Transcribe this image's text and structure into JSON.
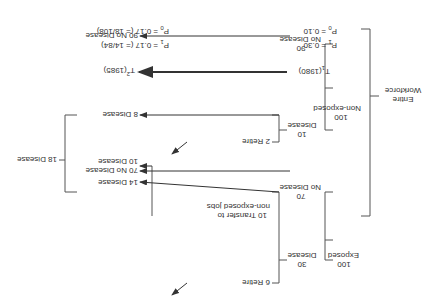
{
  "root": {
    "line1": "Entire",
    "line2": "Workforce"
  },
  "exposed": {
    "count": "100",
    "label": "Exposed",
    "disease": {
      "count": "30",
      "label": "Disease"
    },
    "no_disease": {
      "count": "70",
      "label": "No Disease"
    },
    "branches": {
      "retire": "6  Retire",
      "transfer1": "10 Transfer to",
      "transfer2": "non-exposed jobs",
      "disease_out": "14 Disease",
      "no_disease_out": "70 No Disease"
    }
  },
  "non_exposed": {
    "count": "100",
    "label": "Non-exposed",
    "disease": {
      "count": "10",
      "label": "Disease"
    },
    "no_disease": {
      "count": "90",
      "label": "No Disease"
    },
    "branches": {
      "retire": "2  Retire",
      "disease_out": "8  Disease",
      "transfer_in": "10 Disease",
      "no_disease_out": "90 No Disease"
    }
  },
  "combined": "18 Disease",
  "timeline": {
    "t1": "T",
    "t1_sub": "1",
    "t1_year": "(1980)",
    "t2": "T",
    "t2_sup": "2",
    "t2_year": "(1985)"
  },
  "probs_t1": {
    "p1": "P",
    "p1_idx": "1",
    "p1_val": " = 0.30",
    "p0": "P",
    "p0_idx": "0",
    "p0_val": " = 0.10"
  },
  "probs_t2": {
    "p1": "P",
    "p1_idx": "1",
    "p1_val": " = 0.17 (= 14/84)",
    "p0": "P",
    "p0_idx": "0",
    "p0_val": " = 0.17 (= 18/108)"
  }
}
